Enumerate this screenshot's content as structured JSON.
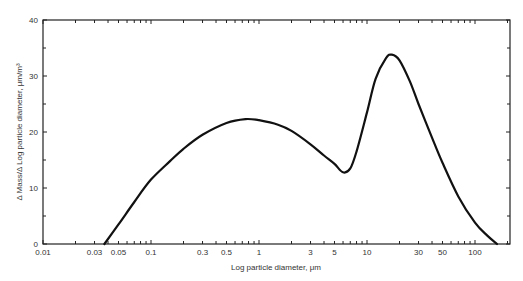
{
  "chart_data": {
    "type": "line",
    "title": "",
    "xlabel": "Log particle diameter, μm",
    "ylabel": "Δ Mass/Δ Log particle diameter, μm/m³",
    "xscale": "log",
    "xlim": [
      0.01,
      200
    ],
    "ylim": [
      0,
      40
    ],
    "grid": false,
    "legend": null,
    "x_tick_labels": [
      "0.01",
      "0.03",
      "0.05",
      "0.1",
      "0.3",
      "0.5",
      "1",
      "3",
      "5",
      "10",
      "30",
      "50",
      "100"
    ],
    "y_tick_labels": [
      "0",
      "10",
      "20",
      "30",
      "40"
    ],
    "series": [
      {
        "name": "Mass size distribution",
        "x": [
          0.037,
          0.05,
          0.07,
          0.1,
          0.15,
          0.2,
          0.3,
          0.5,
          0.75,
          1.0,
          1.5,
          2,
          3,
          4,
          5,
          6,
          7,
          8,
          10,
          12,
          15,
          17,
          20,
          25,
          30,
          40,
          50,
          70,
          100,
          130,
          160
        ],
        "values": [
          0,
          3.5,
          7.5,
          11.5,
          14.8,
          17,
          19.5,
          21.6,
          22.3,
          22.1,
          21.3,
          20.2,
          17.8,
          15.8,
          14.3,
          12.8,
          13.5,
          16.5,
          23.5,
          29.5,
          33.2,
          33.8,
          32.8,
          29.0,
          25.0,
          19.0,
          14.5,
          8.5,
          3.8,
          1.5,
          0
        ]
      }
    ]
  }
}
